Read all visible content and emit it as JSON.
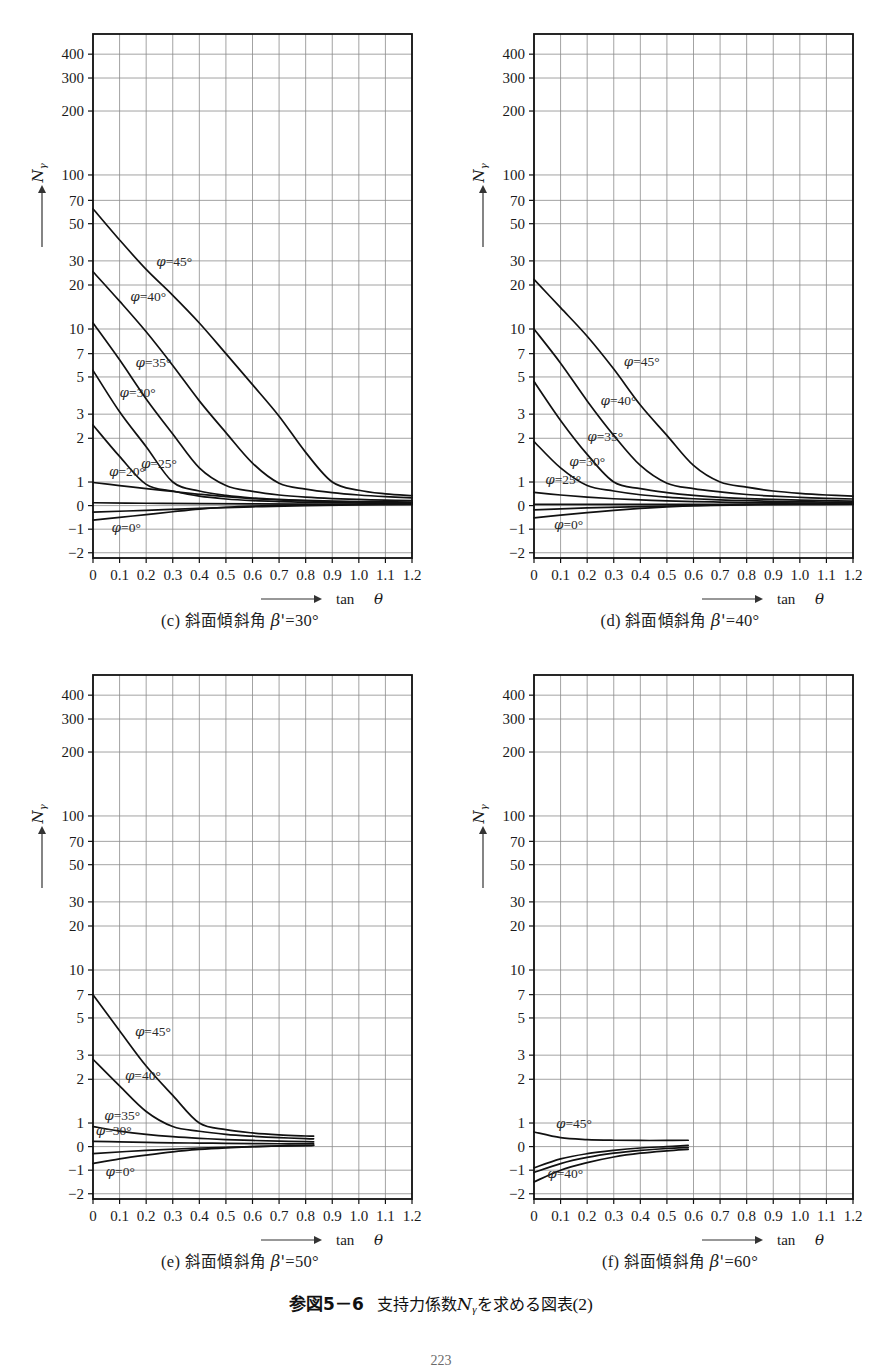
{
  "figure": {
    "number": "参図5－6",
    "title_jp": "支持力係数",
    "symbol": "N",
    "symbol_sub": "γ",
    "title_jp_tail": "を求める図表",
    "title_index": "(2)",
    "page_number": "223"
  },
  "axes": {
    "y_label_symbol": "N",
    "y_label_sub": "γ",
    "x_label": "tan",
    "x_label_var": "θ",
    "y_ticks": [
      "400",
      "300",
      "200",
      "100",
      "70",
      "50",
      "30",
      "20",
      "10",
      "7",
      "5",
      "3",
      "2",
      "1",
      "0",
      "-1",
      "-2"
    ],
    "y_tick_values": [
      400,
      300,
      200,
      100,
      70,
      50,
      30,
      20,
      10,
      7,
      5,
      3,
      2,
      1,
      0,
      -1,
      -2
    ],
    "x_ticks": [
      "0",
      "0.1",
      "0.2",
      "0.3",
      "0.4",
      "0.5",
      "0.6",
      "0.7",
      "0.8",
      "0.9",
      "1.0",
      "1.1",
      "1.2"
    ],
    "x_tick_values": [
      0,
      0.1,
      0.2,
      0.3,
      0.4,
      0.5,
      0.6,
      0.7,
      0.8,
      0.9,
      1.0,
      1.1,
      1.2
    ],
    "xlim": [
      0,
      1.2
    ],
    "grid": true,
    "y_scale": "log-above-1-linear-below"
  },
  "panels": [
    {
      "id": "c",
      "letter": "(c)",
      "caption_jp": "斜面傾斜角",
      "caption_var": "β'",
      "caption_eq": "=",
      "caption_value": "30°",
      "beta": 30
    },
    {
      "id": "d",
      "letter": "(d)",
      "caption_jp": "斜面傾斜角",
      "caption_var": "β'",
      "caption_eq": "=",
      "caption_value": "40°",
      "beta": 40
    },
    {
      "id": "e",
      "letter": "(e)",
      "caption_jp": "斜面傾斜角",
      "caption_var": "β'",
      "caption_eq": "=",
      "caption_value": "50°",
      "beta": 50
    },
    {
      "id": "f",
      "letter": "(f)",
      "caption_jp": "斜面傾斜角",
      "caption_var": "β'",
      "caption_eq": "=",
      "caption_value": "60°",
      "beta": 60
    }
  ],
  "chart_data": {
    "type": "line",
    "xlabel": "tan θ",
    "ylabel": "Nγ",
    "xlim": [
      0,
      1.2
    ],
    "grid": true,
    "legend": "inline curve labels",
    "y_axis_note": "Log scale above 1; linear segments for 1, 0, -1, -2",
    "panels": [
      {
        "id": "c",
        "subtitle": "(c) 斜面傾斜角 β' = 30°",
        "beta_prime": 30,
        "series": [
          {
            "name": "φ=45°",
            "label": "φ=45°",
            "x": [
              0,
              0.1,
              0.2,
              0.3,
              0.4,
              0.5,
              0.6,
              0.7,
              0.8,
              0.9,
              1.0,
              1.1,
              1.2
            ],
            "y": [
              62,
              40,
              26,
              17,
              11,
              7,
              4.5,
              2.9,
              1.6,
              1.0,
              0.65,
              0.5,
              0.42
            ]
          },
          {
            "name": "φ=40°",
            "label": "φ=40°",
            "x": [
              0,
              0.1,
              0.2,
              0.3,
              0.4,
              0.5,
              0.6,
              0.7,
              0.8,
              0.9,
              1.0,
              1.1,
              1.2
            ],
            "y": [
              25,
              15.5,
              9.6,
              5.9,
              3.6,
              2.2,
              1.35,
              0.95,
              0.7,
              0.55,
              0.45,
              0.38,
              0.33
            ]
          },
          {
            "name": "φ=35°",
            "label": "φ=35°",
            "x": [
              0,
              0.1,
              0.2,
              0.3,
              0.4,
              0.5,
              0.6,
              0.7,
              0.8,
              0.9,
              1.0,
              1.1,
              1.2
            ],
            "y": [
              11,
              6.4,
              3.7,
              2.15,
              1.25,
              0.85,
              0.6,
              0.45,
              0.36,
              0.3,
              0.26,
              0.23,
              0.21
            ]
          },
          {
            "name": "φ=30°",
            "label": "φ=30°",
            "x": [
              0,
              0.1,
              0.2,
              0.3,
              0.4,
              0.5,
              0.6,
              0.7,
              0.8,
              0.9,
              1.0,
              1.1,
              1.2
            ],
            "y": [
              5.5,
              3.1,
              1.75,
              1.0,
              0.62,
              0.43,
              0.32,
              0.26,
              0.22,
              0.19,
              0.17,
              0.16,
              0.15
            ]
          },
          {
            "name": "φ=25°",
            "label": "φ=25°",
            "x": [
              0,
              0.1,
              0.2,
              0.3,
              0.4,
              0.5,
              0.6,
              0.7,
              0.8,
              0.9,
              1.0,
              1.1,
              1.2
            ],
            "y": [
              2.5,
              1.5,
              0.9,
              0.62,
              0.4,
              0.28,
              0.21,
              0.17,
              0.14,
              0.12,
              0.11,
              0.1,
              0.1
            ]
          },
          {
            "name": "φ=20°",
            "label": "φ=20°",
            "x": [
              0,
              0.1,
              0.2,
              0.3,
              0.4,
              0.5,
              0.6,
              0.7,
              0.8,
              0.9,
              1.0,
              1.1,
              1.2
            ],
            "y": [
              0.98,
              0.85,
              0.72,
              0.6,
              0.48,
              0.38,
              0.3,
              0.24,
              0.2,
              0.17,
              0.15,
              0.13,
              0.12
            ]
          },
          {
            "name": "φ=10°",
            "label": "",
            "x": [
              0,
              0.2,
              0.4,
              0.6,
              0.8,
              1.0,
              1.2
            ],
            "y": [
              0.12,
              0.1,
              0.08,
              0.07,
              0.06,
              0.05,
              0.05
            ]
          },
          {
            "name": "φ=0°",
            "label": "φ=0°",
            "x": [
              0,
              0.1,
              0.2,
              0.3,
              0.4,
              0.5,
              0.6,
              0.7,
              0.8,
              0.9,
              1.0,
              1.1,
              1.2
            ],
            "y": [
              -0.62,
              -0.5,
              -0.38,
              -0.26,
              -0.15,
              -0.07,
              -0.02,
              0.01,
              0.03,
              0.05,
              0.06,
              0.07,
              0.08
            ]
          },
          {
            "name": "φ=5°",
            "label": "",
            "x": [
              0,
              0.2,
              0.4,
              0.6,
              0.8,
              1.0,
              1.2
            ],
            "y": [
              -0.28,
              -0.2,
              -0.12,
              -0.05,
              0.0,
              0.03,
              0.05
            ]
          }
        ]
      },
      {
        "id": "d",
        "subtitle": "(d) 斜面傾斜角 β' = 40°",
        "beta_prime": 40,
        "series": [
          {
            "name": "φ=45°",
            "label": "φ=45°",
            "x": [
              0,
              0.1,
              0.2,
              0.3,
              0.4,
              0.5,
              0.6,
              0.7,
              0.8,
              0.9,
              1.0,
              1.1,
              1.2
            ],
            "y": [
              22,
              14,
              9,
              5.6,
              3.4,
              2.1,
              1.3,
              1.0,
              0.78,
              0.62,
              0.52,
              0.45,
              0.4
            ]
          },
          {
            "name": "φ=40°",
            "label": "φ=40°",
            "x": [
              0,
              0.1,
              0.2,
              0.3,
              0.4,
              0.5,
              0.6,
              0.7,
              0.8,
              0.9,
              1.0,
              1.1,
              1.2
            ],
            "y": [
              10,
              6.1,
              3.6,
              2.1,
              1.3,
              0.95,
              0.72,
              0.58,
              0.47,
              0.4,
              0.35,
              0.31,
              0.28
            ]
          },
          {
            "name": "φ=35°",
            "label": "φ=35°",
            "x": [
              0,
              0.1,
              0.2,
              0.3,
              0.4,
              0.5,
              0.6,
              0.7,
              0.8,
              0.9,
              1.0,
              1.1,
              1.2
            ],
            "y": [
              4.7,
              2.7,
              1.55,
              1.0,
              0.72,
              0.55,
              0.43,
              0.35,
              0.3,
              0.26,
              0.23,
              0.21,
              0.19
            ]
          },
          {
            "name": "φ=30°",
            "label": "φ=30°",
            "x": [
              0,
              0.1,
              0.2,
              0.3,
              0.4,
              0.5,
              0.6,
              0.7,
              0.8,
              0.9,
              1.0,
              1.1,
              1.2
            ],
            "y": [
              1.9,
              1.25,
              0.85,
              0.62,
              0.46,
              0.36,
              0.29,
              0.24,
              0.21,
              0.18,
              0.16,
              0.15,
              0.14
            ]
          },
          {
            "name": "φ=25°",
            "label": "φ=25°",
            "x": [
              0,
              0.1,
              0.2,
              0.3,
              0.4,
              0.5,
              0.6,
              0.7,
              0.8,
              0.9,
              1.0,
              1.1,
              1.2
            ],
            "y": [
              0.56,
              0.45,
              0.36,
              0.29,
              0.24,
              0.2,
              0.17,
              0.15,
              0.13,
              0.12,
              0.11,
              0.1,
              0.1
            ]
          },
          {
            "name": "φ=15°",
            "label": "",
            "x": [
              0,
              0.2,
              0.4,
              0.6,
              0.8,
              1.0,
              1.2
            ],
            "y": [
              0.05,
              0.05,
              0.05,
              0.05,
              0.05,
              0.05,
              0.05
            ]
          },
          {
            "name": "φ=10°",
            "label": "",
            "x": [
              0,
              0.2,
              0.4,
              0.6,
              0.8,
              1.0,
              1.2
            ],
            "y": [
              -0.18,
              -0.1,
              -0.04,
              0.0,
              0.03,
              0.05,
              0.06
            ]
          },
          {
            "name": "φ=0°",
            "label": "φ=0°",
            "x": [
              0,
              0.1,
              0.2,
              0.3,
              0.4,
              0.5,
              0.6,
              0.7,
              0.8,
              0.9,
              1.0,
              1.1,
              1.2
            ],
            "y": [
              -0.52,
              -0.4,
              -0.3,
              -0.2,
              -0.12,
              -0.05,
              0.0,
              0.03,
              0.05,
              0.07,
              0.08,
              0.09,
              0.1
            ]
          }
        ]
      },
      {
        "id": "e",
        "subtitle": "(e) 斜面傾斜角 β' = 50°",
        "beta_prime": 50,
        "xmax_data": 0.83,
        "series": [
          {
            "name": "φ=45°",
            "label": "φ=45°",
            "x": [
              0,
              0.1,
              0.2,
              0.3,
              0.4,
              0.5,
              0.6,
              0.7,
              0.8,
              0.83
            ],
            "y": [
              7.0,
              4.2,
              2.5,
              1.55,
              1.0,
              0.72,
              0.58,
              0.5,
              0.45,
              0.44
            ]
          },
          {
            "name": "φ=40°",
            "label": "φ=40°",
            "x": [
              0,
              0.1,
              0.2,
              0.3,
              0.4,
              0.5,
              0.6,
              0.7,
              0.8,
              0.83
            ],
            "y": [
              2.8,
              1.8,
              1.2,
              0.85,
              0.65,
              0.52,
              0.44,
              0.38,
              0.34,
              0.33
            ]
          },
          {
            "name": "φ=35°",
            "label": "φ=35°",
            "x": [
              0,
              0.1,
              0.2,
              0.3,
              0.4,
              0.5,
              0.6,
              0.7,
              0.8,
              0.83
            ],
            "y": [
              0.85,
              0.66,
              0.52,
              0.42,
              0.35,
              0.3,
              0.26,
              0.23,
              0.21,
              0.2
            ]
          },
          {
            "name": "φ=30°",
            "label": "φ=30°",
            "x": [
              0,
              0.1,
              0.2,
              0.3,
              0.4,
              0.5,
              0.6,
              0.7,
              0.8,
              0.83
            ],
            "y": [
              0.22,
              0.2,
              0.18,
              0.16,
              0.15,
              0.14,
              0.13,
              0.12,
              0.12,
              0.12
            ]
          },
          {
            "name": "φ=20°",
            "label": "",
            "x": [
              0,
              0.2,
              0.4,
              0.6,
              0.8,
              0.83
            ],
            "y": [
              -0.3,
              -0.16,
              -0.06,
              0.0,
              0.04,
              0.05
            ]
          },
          {
            "name": "φ=0°",
            "label": "φ=0°",
            "x": [
              0,
              0.1,
              0.2,
              0.3,
              0.4,
              0.5,
              0.6,
              0.7,
              0.8,
              0.83
            ],
            "y": [
              -0.72,
              -0.52,
              -0.36,
              -0.22,
              -0.12,
              -0.05,
              0.0,
              0.03,
              0.05,
              0.06
            ]
          }
        ]
      },
      {
        "id": "f",
        "subtitle": "(f) 斜面傾斜角 β' = 60°",
        "beta_prime": 60,
        "xmax_data": 0.58,
        "series": [
          {
            "name": "φ=45°",
            "label": "φ=45°",
            "x": [
              0,
              0.1,
              0.2,
              0.3,
              0.4,
              0.5,
              0.58
            ],
            "y": [
              0.62,
              0.38,
              0.3,
              0.27,
              0.26,
              0.26,
              0.27
            ]
          },
          {
            "name": "φ=40°",
            "label": "φ=40°",
            "x": [
              0,
              0.1,
              0.2,
              0.3,
              0.4,
              0.5,
              0.58
            ],
            "y": [
              -0.9,
              -0.52,
              -0.3,
              -0.16,
              -0.06,
              0.0,
              0.05
            ]
          },
          {
            "name": "φ=35°",
            "label": "",
            "x": [
              0,
              0.1,
              0.2,
              0.3,
              0.4,
              0.5,
              0.58
            ],
            "y": [
              -1.1,
              -0.72,
              -0.46,
              -0.28,
              -0.16,
              -0.08,
              -0.04
            ]
          },
          {
            "name": "φ=0°",
            "label": "",
            "x": [
              0,
              0.1,
              0.2,
              0.3,
              0.4,
              0.5,
              0.58
            ],
            "y": [
              -1.5,
              -1.0,
              -0.68,
              -0.44,
              -0.28,
              -0.18,
              -0.12
            ]
          }
        ]
      }
    ]
  }
}
